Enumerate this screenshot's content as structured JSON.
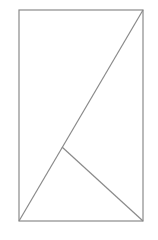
{
  "diagram": {
    "type": "geometry",
    "stroke_color": "#8a8a8a",
    "background": "#ffffff",
    "stroke_width": 1.2,
    "rectangle": {
      "x": 19,
      "y": 10,
      "width": 124,
      "height": 211
    },
    "points": {
      "bottom_left": [
        19,
        221
      ],
      "top_left": [
        19,
        10
      ],
      "top_right": [
        143,
        10
      ],
      "bottom_right": [
        143,
        221
      ],
      "foot": [
        62,
        147
      ]
    },
    "segments": [
      {
        "name": "diagonal",
        "from": "bottom_left",
        "to": "top_right"
      },
      {
        "name": "perpendicular",
        "from": "bottom_right",
        "to": "foot"
      }
    ],
    "labels": []
  }
}
